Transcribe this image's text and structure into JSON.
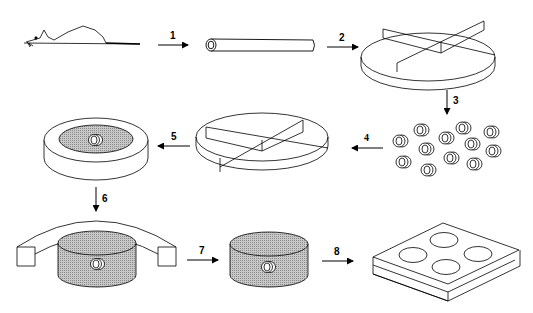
{
  "diagram": {
    "type": "process-flow",
    "colors": {
      "stroke": "#000000",
      "fill_gray": "#b8b8b8",
      "background": "#ffffff"
    },
    "steps": [
      {
        "id": 1,
        "label": "1",
        "from": "mouse",
        "to": "tube"
      },
      {
        "id": 2,
        "label": "2",
        "from": "tube",
        "to": "divided-dish-top"
      },
      {
        "id": 3,
        "label": "3",
        "from": "divided-dish-top",
        "to": "tube-segments"
      },
      {
        "id": 4,
        "label": "4",
        "from": "tube-segments",
        "to": "divided-dish-middle"
      },
      {
        "id": 5,
        "label": "5",
        "from": "divided-dish-middle",
        "to": "embedded-disc"
      },
      {
        "id": 6,
        "label": "6",
        "from": "embedded-disc",
        "to": "cylinder-with-mold"
      },
      {
        "id": 7,
        "label": "7",
        "from": "cylinder-with-mold",
        "to": "cylinder-block"
      },
      {
        "id": 8,
        "label": "8",
        "from": "cylinder-block",
        "to": "well-plate"
      }
    ],
    "objects": [
      "mouse",
      "tube",
      "divided-dish-top",
      "tube-segments",
      "divided-dish-middle",
      "embedded-disc",
      "cylinder-with-mold",
      "cylinder-block",
      "well-plate"
    ],
    "segment_count": 13,
    "well_count": 4
  }
}
